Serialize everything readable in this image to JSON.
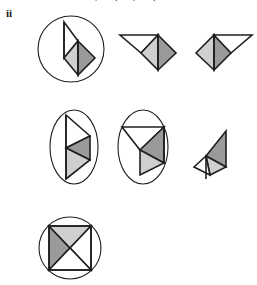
{
  "page": {
    "label": "ii",
    "clipped_header_text": "g t g t",
    "background_color": "#ffffff",
    "width": 257,
    "height": 285
  },
  "palette": {
    "stroke": "#1f1f1f",
    "white_fill": "#ffffff",
    "light_gray_fill": "#cfcfcf",
    "mid_gray_fill": "#9a9a9a"
  },
  "figures": [
    {
      "id": "figure-1",
      "name": "circle-with-triangles-right-pointing",
      "row": 1,
      "position": 1,
      "container": "circle",
      "container_label": "circle",
      "shape_label": "two stacked triangles forming a right-pointing arrowhead",
      "parts": [
        {
          "name": "upper-triangle",
          "fill": "white"
        },
        {
          "name": "lower-left-triangle",
          "fill": "light_gray"
        },
        {
          "name": "lower-right-triangle",
          "fill": "mid_gray"
        }
      ]
    },
    {
      "id": "figure-2",
      "name": "triangles-left-white-right-gray",
      "row": 1,
      "position": 2,
      "container": "none",
      "container_label": "none",
      "shape_label": "white triangle left joined to gray diamond right",
      "parts": [
        {
          "name": "left-triangle",
          "fill": "white"
        },
        {
          "name": "middle-triangle",
          "fill": "light_gray"
        },
        {
          "name": "right-triangle",
          "fill": "mid_gray"
        }
      ]
    },
    {
      "id": "figure-3",
      "name": "triangles-left-gray-right-white",
      "row": 1,
      "position": 3,
      "container": "none",
      "container_label": "none",
      "shape_label": "gray diamond left joined to white triangle right",
      "parts": [
        {
          "name": "left-triangle",
          "fill": "light_gray"
        },
        {
          "name": "middle-triangle",
          "fill": "mid_gray"
        },
        {
          "name": "right-triangle",
          "fill": "white"
        }
      ]
    },
    {
      "id": "figure-4",
      "name": "ellipse-with-left-pointing-triangles",
      "row": 2,
      "position": 1,
      "container": "ellipse",
      "container_label": "ellipse",
      "shape_label": "vertical bar with left-pointing gray triangle and white triangle",
      "parts": [
        {
          "name": "upper-triangle",
          "fill": "white"
        },
        {
          "name": "middle-triangle",
          "fill": "mid_gray"
        },
        {
          "name": "lower-triangle",
          "fill": "light_gray"
        }
      ]
    },
    {
      "id": "figure-5",
      "name": "ellipse-with-down-pointing-triangles",
      "row": 2,
      "position": 2,
      "container": "ellipse",
      "container_label": "ellipse",
      "shape_label": "white triangle above, gray triangles below pointing down",
      "parts": [
        {
          "name": "top-triangle",
          "fill": "white"
        },
        {
          "name": "right-triangle",
          "fill": "mid_gray"
        },
        {
          "name": "bottom-triangle",
          "fill": "light_gray"
        }
      ]
    },
    {
      "id": "figure-6",
      "name": "small-triangles-diamond",
      "row": 2,
      "position": 3,
      "container": "none",
      "container_label": "none",
      "shape_label": "small diamond with gray upper triangle and light lower triangle",
      "parts": [
        {
          "name": "upper-triangle",
          "fill": "mid_gray"
        },
        {
          "name": "lower-right-triangle",
          "fill": "light_gray"
        },
        {
          "name": "lower-left-triangle",
          "fill": "white"
        }
      ]
    },
    {
      "id": "figure-7",
      "name": "circle-with-square-x",
      "row": 3,
      "position": 1,
      "container": "circle",
      "container_label": "circle",
      "shape_label": "square crossed by two diagonals forming an X",
      "parts": [
        {
          "name": "left-triangle",
          "fill": "mid_gray"
        },
        {
          "name": "top-triangle",
          "fill": "light_gray"
        },
        {
          "name": "right-triangle",
          "fill": "white"
        },
        {
          "name": "bottom-triangle",
          "fill": "white"
        }
      ]
    }
  ]
}
